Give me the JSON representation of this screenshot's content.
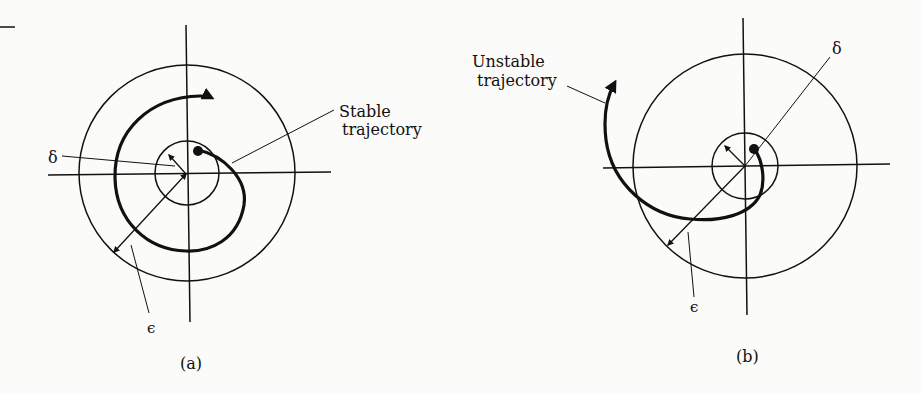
{
  "panels": [
    {
      "id": "a",
      "caption": "(a)",
      "trajectory_label_line1": "Stable",
      "trajectory_label_line2": "trajectory",
      "delta_label": "δ",
      "epsilon_label": "ϵ"
    },
    {
      "id": "b",
      "caption": "(b)",
      "trajectory_label_line1": "Unstable",
      "trajectory_label_line2": "trajectory",
      "delta_label": "δ",
      "epsilon_label": "ϵ"
    }
  ],
  "colors": {
    "ink": "#111111",
    "paper": "#fbfbf9"
  }
}
